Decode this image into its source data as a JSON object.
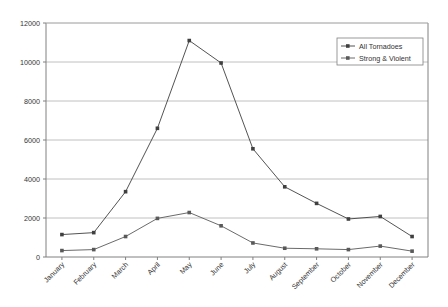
{
  "chart_data": {
    "type": "line",
    "title": "",
    "xlabel": "",
    "ylabel": "",
    "categories": [
      "January",
      "February",
      "March",
      "April",
      "May",
      "June",
      "July",
      "August",
      "September",
      "October",
      "November",
      "December"
    ],
    "series": [
      {
        "name": "All Tornadoes",
        "values": [
          1150,
          1250,
          3350,
          6600,
          11100,
          9950,
          5550,
          3600,
          2750,
          1950,
          2080,
          1050
        ]
      },
      {
        "name": "Strong & Violent",
        "values": [
          330,
          380,
          1050,
          1980,
          2280,
          1600,
          720,
          450,
          420,
          380,
          560,
          300
        ]
      }
    ],
    "ylim": [
      0,
      12000
    ],
    "yticks": [
      "0",
      "2000",
      "4000",
      "6000",
      "8000",
      "10000",
      "12000"
    ],
    "ytick_values": [
      0,
      2000,
      4000,
      6000,
      8000,
      10000,
      12000
    ],
    "grid": true,
    "legend_position": "top-right",
    "marker": "square",
    "colors": {
      "all_tornadoes": "#404040",
      "strong_violent": "#595959",
      "grid": "#b0b0b0",
      "axis": "#808080",
      "text": "#333333"
    }
  },
  "legend": {
    "items": [
      {
        "label": "All Tornadoes",
        "marker": "square-marker"
      },
      {
        "label": "Strong & Violent",
        "marker": "square-marker"
      }
    ]
  }
}
